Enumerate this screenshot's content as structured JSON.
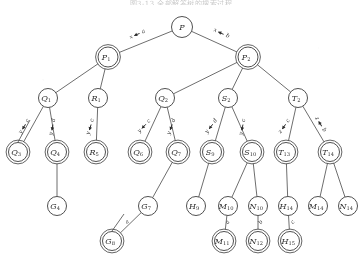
{
  "figure": {
    "caption": "图3-13 全部解答树的搜索过程",
    "background_color": "#fbfbfa",
    "ink_color": "#3d3d3d"
  },
  "tree": {
    "title": "search tree",
    "nodes": [
      {
        "id": "P",
        "letter": "P",
        "sub": "",
        "x": 182,
        "y": 27,
        "r": 10.5,
        "double": false
      },
      {
        "id": "P1",
        "letter": "P",
        "sub": "1",
        "x": 108,
        "y": 57,
        "r": 10.0,
        "double": true
      },
      {
        "id": "P2",
        "letter": "P",
        "sub": "2",
        "x": 248,
        "y": 57,
        "r": 10.0,
        "double": true
      },
      {
        "id": "Q1",
        "letter": "Q",
        "sub": "1",
        "x": 48,
        "y": 98,
        "r": 9.5,
        "double": false
      },
      {
        "id": "R1",
        "letter": "R",
        "sub": "1",
        "x": 98,
        "y": 98,
        "r": 9.5,
        "double": false
      },
      {
        "id": "Q2",
        "letter": "Q",
        "sub": "2",
        "x": 165,
        "y": 98,
        "r": 9.5,
        "double": false
      },
      {
        "id": "S2",
        "letter": "S",
        "sub": "2",
        "x": 228,
        "y": 98,
        "r": 9.5,
        "double": false
      },
      {
        "id": "T2",
        "letter": "T",
        "sub": "2",
        "x": 298,
        "y": 98,
        "r": 9.5,
        "double": false
      },
      {
        "id": "Q3",
        "letter": "Q",
        "sub": "3",
        "x": 18,
        "y": 152,
        "r": 9.5,
        "double": true
      },
      {
        "id": "Q4",
        "letter": "Q",
        "sub": "4",
        "x": 57,
        "y": 152,
        "r": 9.5,
        "double": true
      },
      {
        "id": "R5",
        "letter": "R",
        "sub": "5",
        "x": 96,
        "y": 152,
        "r": 9.5,
        "double": true
      },
      {
        "id": "Q6",
        "letter": "Q",
        "sub": "6",
        "x": 140,
        "y": 152,
        "r": 9.5,
        "double": true
      },
      {
        "id": "Q7",
        "letter": "Q",
        "sub": "7",
        "x": 178,
        "y": 152,
        "r": 9.5,
        "double": true
      },
      {
        "id": "S9",
        "letter": "S",
        "sub": "9",
        "x": 212,
        "y": 152,
        "r": 9.5,
        "double": true
      },
      {
        "id": "S10",
        "letter": "S",
        "sub": "10",
        "x": 252,
        "y": 152,
        "r": 9.5,
        "double": true
      },
      {
        "id": "T13",
        "letter": "T",
        "sub": "13",
        "x": 286,
        "y": 152,
        "r": 9.5,
        "double": true
      },
      {
        "id": "T14",
        "letter": "T",
        "sub": "14",
        "x": 330,
        "y": 152,
        "r": 9.5,
        "double": true
      },
      {
        "id": "G4",
        "letter": "G",
        "sub": "4",
        "x": 57,
        "y": 206,
        "r": 9.5,
        "double": false
      },
      {
        "id": "G7",
        "letter": "G",
        "sub": "7",
        "x": 148,
        "y": 206,
        "r": 9.5,
        "double": false
      },
      {
        "id": "H9",
        "letter": "H",
        "sub": "9",
        "x": 196,
        "y": 206,
        "r": 9.5,
        "double": false
      },
      {
        "id": "M10",
        "letter": "M",
        "sub": "10",
        "x": 228,
        "y": 206,
        "r": 9.5,
        "double": false
      },
      {
        "id": "N10",
        "letter": "N",
        "sub": "10",
        "x": 258,
        "y": 206,
        "r": 9.5,
        "double": false
      },
      {
        "id": "H14",
        "letter": "H",
        "sub": "14",
        "x": 288,
        "y": 206,
        "r": 9.5,
        "double": false
      },
      {
        "id": "M14",
        "letter": "M",
        "sub": "14",
        "x": 318,
        "y": 206,
        "r": 9.5,
        "double": false
      },
      {
        "id": "N14",
        "letter": "N",
        "sub": "14",
        "x": 348,
        "y": 206,
        "r": 9.5,
        "double": false
      },
      {
        "id": "G8",
        "letter": "G",
        "sub": "8",
        "x": 112,
        "y": 241,
        "r": 9.5,
        "double": true
      },
      {
        "id": "M11",
        "letter": "M",
        "sub": "11",
        "x": 224,
        "y": 241,
        "r": 9.5,
        "double": true
      },
      {
        "id": "N12",
        "letter": "N",
        "sub": "12",
        "x": 258,
        "y": 241,
        "r": 9.5,
        "double": true
      },
      {
        "id": "H15",
        "letter": "H",
        "sub": "15",
        "x": 290,
        "y": 241,
        "r": 9.5,
        "double": true
      }
    ],
    "edges": [
      {
        "from": "P",
        "to": "P1",
        "label_var": "x",
        "label_val": "a",
        "lx": 139,
        "ly": 35,
        "rot": -24
      },
      {
        "from": "P",
        "to": "P2",
        "label_var": "x",
        "label_val": "b",
        "lx": 222,
        "ly": 35,
        "rot": 24
      },
      {
        "from": "P1",
        "to": "Q1",
        "label_var": "",
        "label_val": "",
        "lx": 0,
        "ly": 0,
        "rot": 0
      },
      {
        "from": "P1",
        "to": "R1",
        "label_var": "",
        "label_val": "",
        "lx": 0,
        "ly": 0,
        "rot": 0
      },
      {
        "from": "P2",
        "to": "Q2",
        "label_var": "",
        "label_val": "",
        "lx": 0,
        "ly": 0,
        "rot": 0
      },
      {
        "from": "P2",
        "to": "S2",
        "label_var": "",
        "label_val": "",
        "lx": 0,
        "ly": 0,
        "rot": 0
      },
      {
        "from": "P2",
        "to": "T2",
        "label_var": "",
        "label_val": "",
        "lx": 0,
        "ly": 0,
        "rot": 0
      },
      {
        "from": "Q1",
        "to": "Q3",
        "label_var": "y",
        "label_val": "c",
        "lx": 26,
        "ly": 126,
        "rot": -58
      },
      {
        "from": "Q1",
        "to": "Q4",
        "label_var": "y",
        "label_val": "d",
        "lx": 54,
        "ly": 126,
        "rot": -80
      },
      {
        "from": "R1",
        "to": "R5",
        "label_var": "y",
        "label_val": "c",
        "lx": 92,
        "ly": 126,
        "rot": -74
      },
      {
        "from": "Q2",
        "to": "Q6",
        "label_var": "y",
        "label_val": "c",
        "lx": 146,
        "ly": 126,
        "rot": -47
      },
      {
        "from": "Q2",
        "to": "Q7",
        "label_var": "y",
        "label_val": "d",
        "lx": 173,
        "ly": 126,
        "rot": -70
      },
      {
        "from": "S2",
        "to": "S9",
        "label_var": "y",
        "label_val": "d",
        "lx": 213,
        "ly": 126,
        "rot": -53
      },
      {
        "from": "S2",
        "to": "S10",
        "label_var": "y",
        "label_val": "c",
        "lx": 244,
        "ly": 126,
        "rot": -79
      },
      {
        "from": "T2",
        "to": "T13",
        "label_var": "z",
        "label_val": "c",
        "lx": 286,
        "ly": 126,
        "rot": -56
      },
      {
        "from": "T2",
        "to": "T14",
        "label_var": "z",
        "label_val": "b",
        "lx": 320,
        "ly": 126,
        "rot": 58
      },
      {
        "from": "Q4",
        "to": "G4",
        "label_var": "",
        "label_val": "",
        "lx": 0,
        "ly": 0,
        "rot": 0
      },
      {
        "from": "Q7",
        "to": "G7",
        "label_var": "",
        "label_val": "",
        "lx": 0,
        "ly": 0,
        "rot": 0
      },
      {
        "from": "S9",
        "to": "H9",
        "label_var": "",
        "label_val": "",
        "lx": 0,
        "ly": 0,
        "rot": 0
      },
      {
        "from": "S10",
        "to": "M10",
        "label_var": "",
        "label_val": "",
        "lx": 0,
        "ly": 0,
        "rot": 0
      },
      {
        "from": "S10",
        "to": "N10",
        "label_var": "",
        "label_val": "",
        "lx": 0,
        "ly": 0,
        "rot": 0
      },
      {
        "from": "T13",
        "to": "H14",
        "label_var": "",
        "label_val": "",
        "lx": 0,
        "ly": 0,
        "rot": 0
      },
      {
        "from": "T14",
        "to": "M14",
        "label_var": "",
        "label_val": "",
        "lx": 0,
        "ly": 0,
        "rot": 0
      },
      {
        "from": "T14",
        "to": "N14",
        "label_var": "",
        "label_val": "",
        "lx": 0,
        "ly": 0,
        "rot": 0
      },
      {
        "from": "G7",
        "to": "G8",
        "label_var": "",
        "label_val": "a",
        "lx": 128,
        "ly": 223,
        "rot": -38
      },
      {
        "from": "M10",
        "to": "M11",
        "label_var": "",
        "label_val": "a",
        "lx": 229,
        "ly": 223,
        "rot": -58
      },
      {
        "from": "N10",
        "to": "N12",
        "label_var": "",
        "label_val": "b",
        "lx": 262,
        "ly": 223,
        "rot": -58
      },
      {
        "from": "H14",
        "to": "H15",
        "label_var": "",
        "label_val": "c",
        "lx": 294,
        "ly": 223,
        "rot": -58
      }
    ],
    "extra_stub_edges": [
      {
        "x1": 18,
        "y1": 142,
        "x2": 30,
        "y2": 120
      },
      {
        "x1": 112,
        "y1": 231,
        "x2": 124,
        "y2": 214
      }
    ]
  }
}
